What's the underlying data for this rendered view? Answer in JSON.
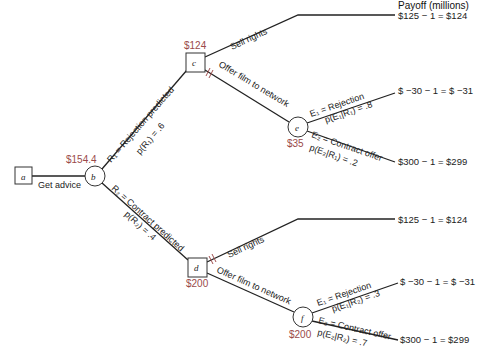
{
  "header": {
    "payoff_label": "Payoff (millions)"
  },
  "nodes": {
    "a": {
      "label": "a",
      "type": "decision"
    },
    "b": {
      "label": "b",
      "type": "chance",
      "value": "$154.4"
    },
    "c": {
      "label": "c",
      "type": "decision",
      "value": "$124"
    },
    "d": {
      "label": "d",
      "type": "decision",
      "value": "$200"
    },
    "e": {
      "label": "e",
      "type": "chance",
      "value": "$35"
    },
    "f": {
      "label": "f",
      "type": "chance",
      "value": "$200"
    }
  },
  "branches": {
    "get_advice": "Get advice",
    "r1": "R₁ = Rejection predicted",
    "r1_prob": "p(R₁) = .6",
    "r2": "R₂ = Contract predicted",
    "r2_prob": "p(R₂) = .4",
    "c_sell": "Sell rights",
    "c_offer": "Offer film to network",
    "d_sell": "Sell rights",
    "d_offer": "Offer film to network",
    "e_e1": "E₁ = Rejection",
    "e_e1_prob": "p(E₁|R₁) = .8",
    "e_e2": "E₂ = Contract offer",
    "e_e2_prob": "p(E₂|R₁) = .2",
    "f_e1": "E₁ = Rejection",
    "f_e1_prob": "p(E₁|R₂) = .3",
    "f_e2": "E₂ = Contract offer",
    "f_e2_prob": "p(E₂|R₂) = .7"
  },
  "payoffs": [
    "$125 − 1 = $124",
    "$ −30 − 1 = $ −31",
    "$300 − 1 = $299",
    "$125 − 1 = $124",
    "$ −30 − 1 = $ −31",
    "$300 − 1 = $299"
  ],
  "colors": {
    "value_text": "#9a4a4a",
    "lines": "#222222"
  }
}
